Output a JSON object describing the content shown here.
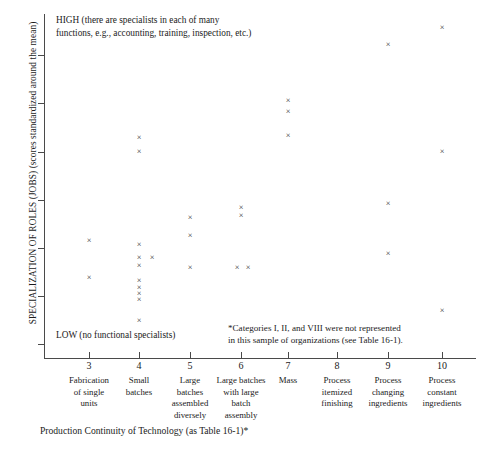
{
  "axes": {
    "ylabel": "SPECIALIZATION OF ROLES (JOBS) (scores standardized around the mean)",
    "xlabel": "Production Continuity of Technology (as Table 16-1)*",
    "high_note": "HIGH (there are specialists in each of many\nfunctions, e.g., accounting, training, inspection, etc.)",
    "high_note_line1": "HIGH (there are specialists in each of many",
    "high_note_line2": "functions, e.g., accounting, training, inspection, etc.)",
    "low_note": "LOW (no functional specialists)",
    "footnote_line1": "*Categories I, II, and VIII were not represented",
    "footnote_line2": "in this sample of organizations (see Table 16-1).",
    "marker": "×"
  },
  "chart_data": {
    "type": "scatter",
    "title": "",
    "xlabel": "Production Continuity of Technology (as Table 16-1)*",
    "ylabel": "SPECIALIZATION OF ROLES (JOBS) (scores standardized around the mean)",
    "grid": false,
    "legend": "none",
    "xlim": [
      2.5,
      10.5
    ],
    "ylim": [
      0,
      100
    ],
    "xticks": [
      3,
      4,
      5,
      6,
      7,
      8,
      9,
      10
    ],
    "xticklabels": [
      "3",
      "4",
      "5",
      "6",
      "7",
      "8",
      "9",
      "10"
    ],
    "xcategories": [
      "Fabrication of single units",
      "Small batches",
      "Large batches assembled diversely",
      "Large batches with large batch assembly",
      "Mass",
      "Process itemized finishing",
      "Process changing ingredients",
      "Process constant ingredients"
    ],
    "xcategories_wrapped": [
      [
        "Fabrication",
        "of single",
        "units"
      ],
      [
        "Small",
        "batches"
      ],
      [
        "Large",
        "batches",
        "assembled",
        "diversely"
      ],
      [
        "Large batches",
        "with large",
        "batch",
        "assembly"
      ],
      [
        "Mass"
      ],
      [
        "Process",
        "itemized",
        "finishing"
      ],
      [
        "Process",
        "changing",
        "ingredients"
      ],
      [
        "Process",
        "constant",
        "ingredients"
      ]
    ],
    "yticks": [
      4,
      18,
      32,
      46,
      60,
      74,
      88
    ],
    "yticklabels": [],
    "points": [
      {
        "x": 3,
        "y": 30.0,
        "px": 89,
        "py": 241
      },
      {
        "x": 3,
        "y": 24.0,
        "px": 89,
        "py": 278
      },
      {
        "x": 4,
        "y": 67.0,
        "px": 139,
        "py": 138
      },
      {
        "x": 4,
        "y": 62.5,
        "px": 139,
        "py": 152
      },
      {
        "x": 4,
        "y": 32.5,
        "px": 139,
        "py": 245
      },
      {
        "x": 4,
        "y": 28.5,
        "px": 139,
        "py": 258
      },
      {
        "x": 4,
        "y": 28.5,
        "px": 152,
        "py": 258
      },
      {
        "x": 4,
        "y": 26.0,
        "px": 139,
        "py": 266
      },
      {
        "x": 4,
        "y": 21.5,
        "px": 139,
        "py": 281
      },
      {
        "x": 4,
        "y": 19.5,
        "px": 139,
        "py": 288
      },
      {
        "x": 4,
        "y": 17.5,
        "px": 139,
        "py": 294
      },
      {
        "x": 4,
        "y": 15.5,
        "px": 139,
        "py": 300
      },
      {
        "x": 4,
        "y": 8.5,
        "px": 139,
        "py": 321
      },
      {
        "x": 5,
        "y": 44.0,
        "px": 190,
        "py": 218
      },
      {
        "x": 5,
        "y": 38.0,
        "px": 190,
        "py": 236
      },
      {
        "x": 5,
        "y": 25.5,
        "px": 190,
        "py": 268
      },
      {
        "x": 6,
        "y": 47.0,
        "px": 241,
        "py": 208
      },
      {
        "x": 6,
        "y": 44.5,
        "px": 241,
        "py": 216
      },
      {
        "x": 6,
        "y": 25.5,
        "px": 237,
        "py": 268
      },
      {
        "x": 6,
        "y": 25.5,
        "px": 248,
        "py": 268
      },
      {
        "x": 7,
        "y": 79.5,
        "px": 288,
        "py": 101
      },
      {
        "x": 7,
        "y": 76.0,
        "px": 288,
        "py": 112
      },
      {
        "x": 7,
        "y": 67.5,
        "px": 288,
        "py": 136
      },
      {
        "x": 9,
        "y": 91.5,
        "px": 388,
        "py": 45
      },
      {
        "x": 9,
        "y": 42.0,
        "px": 388,
        "py": 204
      },
      {
        "x": 9,
        "y": 27.5,
        "px": 388,
        "py": 254
      },
      {
        "x": 10,
        "y": 96.5,
        "px": 442,
        "py": 28
      },
      {
        "x": 10,
        "y": 62.0,
        "px": 442,
        "py": 152
      },
      {
        "x": 10,
        "y": 13.5,
        "px": 442,
        "py": 311
      }
    ]
  }
}
